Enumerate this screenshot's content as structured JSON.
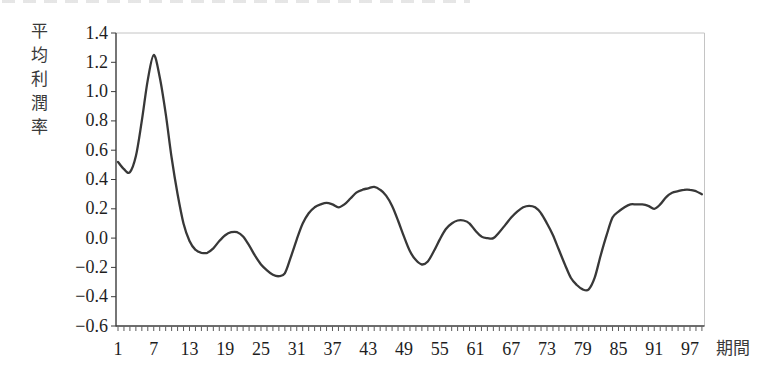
{
  "page": {
    "background": "#ffffff"
  },
  "chart_data": {
    "type": "line",
    "title": "",
    "y_axis_title": "平均利潤率",
    "x_axis_title": "期間",
    "grid": false,
    "legend": false,
    "xlim": [
      1,
      100
    ],
    "ylim": [
      -0.6,
      1.4
    ],
    "y_ticks": [
      1.4,
      1.2,
      1.0,
      0.8,
      0.6,
      0.4,
      0.2,
      0.0,
      -0.2,
      -0.4,
      -0.6
    ],
    "y_tick_labels": [
      "1.4",
      "1.2",
      "1.0",
      "0.8",
      "0.6",
      "0.4",
      "0.2",
      "0.0",
      "−0.2",
      "−0.4",
      "−0.6"
    ],
    "x_ticks": [
      1,
      7,
      13,
      19,
      25,
      31,
      37,
      43,
      49,
      55,
      61,
      67,
      73,
      79,
      85,
      91,
      97
    ],
    "x_tick_labels": [
      "1",
      "7",
      "13",
      "19",
      "25",
      "31",
      "37",
      "43",
      "49",
      "55",
      "61",
      "67",
      "73",
      "79",
      "85",
      "91",
      "97"
    ],
    "x_minor_tick_every": 1,
    "line_color": "#383838",
    "axis_color": "#3c3c3c",
    "frame_color": "#c4c4c4",
    "series": [
      {
        "name": "平均利潤率",
        "x_start": 1,
        "x_step": 1,
        "values": [
          0.52,
          0.47,
          0.45,
          0.56,
          0.8,
          1.08,
          1.25,
          1.1,
          0.85,
          0.55,
          0.3,
          0.1,
          -0.02,
          -0.08,
          -0.1,
          -0.1,
          -0.07,
          -0.02,
          0.02,
          0.04,
          0.04,
          0.01,
          -0.05,
          -0.12,
          -0.18,
          -0.22,
          -0.25,
          -0.26,
          -0.24,
          -0.13,
          -0.01,
          0.1,
          0.17,
          0.21,
          0.23,
          0.24,
          0.23,
          0.21,
          0.23,
          0.27,
          0.31,
          0.33,
          0.34,
          0.35,
          0.33,
          0.29,
          0.22,
          0.12,
          0.01,
          -0.09,
          -0.15,
          -0.18,
          -0.16,
          -0.09,
          -0.01,
          0.06,
          0.1,
          0.12,
          0.12,
          0.1,
          0.05,
          0.01,
          0.0,
          0.0,
          0.04,
          0.09,
          0.14,
          0.18,
          0.21,
          0.22,
          0.21,
          0.17,
          0.1,
          0.02,
          -0.08,
          -0.18,
          -0.27,
          -0.32,
          -0.35,
          -0.35,
          -0.27,
          -0.12,
          0.02,
          0.14,
          0.18,
          0.21,
          0.23,
          0.23,
          0.23,
          0.22,
          0.2,
          0.23,
          0.28,
          0.31,
          0.32,
          0.33,
          0.33,
          0.32,
          0.3
        ]
      }
    ]
  }
}
